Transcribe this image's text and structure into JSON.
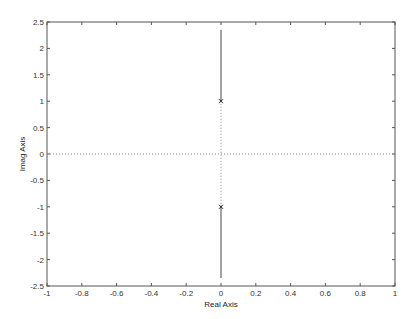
{
  "chart_data": {
    "type": "line",
    "title": "",
    "xlabel": "Real Axis",
    "ylabel": "Imag Axis",
    "xlim": [
      -1,
      1
    ],
    "ylim": [
      -2.5,
      2.5
    ],
    "xticks": [
      -1,
      -0.8,
      -0.6,
      -0.4,
      -0.2,
      0,
      0.2,
      0.4,
      0.6,
      0.8,
      1
    ],
    "xtick_labels": [
      "-1",
      "-0.8",
      "-0.6",
      "-0.4",
      "-0.2",
      "0",
      "0.2",
      "0.4",
      "0.6",
      "0.8",
      "1"
    ],
    "yticks": [
      2.5,
      2,
      1.5,
      1,
      0.5,
      0,
      -0.5,
      -1,
      -1.5,
      -2,
      -2.5
    ],
    "ytick_labels": [
      "2.5",
      "2",
      "1.5",
      "1",
      "0.5",
      "0",
      "-0.5",
      "-1",
      "-1.5",
      "-2",
      "-2.5"
    ],
    "grid": false,
    "legend": null,
    "series": [
      {
        "name": "locus-upper",
        "style": "solid",
        "x": [
          0,
          0
        ],
        "y": [
          1,
          2.35
        ]
      },
      {
        "name": "locus-lower",
        "style": "solid",
        "x": [
          0,
          0
        ],
        "y": [
          -1,
          -2.35
        ]
      },
      {
        "name": "imag-axis-dotted",
        "style": "dotted",
        "x": [
          0,
          0
        ],
        "y": [
          -1,
          1
        ]
      },
      {
        "name": "real-axis-dotted",
        "style": "dotted",
        "x": [
          -1,
          1
        ],
        "y": [
          0,
          0
        ]
      }
    ],
    "poles": [
      {
        "x": 0,
        "y": 1,
        "marker": "x"
      },
      {
        "x": 0,
        "y": -1,
        "marker": "x"
      }
    ]
  },
  "colors": {
    "axes": "#555555",
    "locus": "#444444",
    "dotted": "#888888",
    "background": "#ffffff"
  },
  "layout": {
    "frame": {
      "left": 47,
      "top": 22,
      "right": 395,
      "bottom": 286
    }
  }
}
